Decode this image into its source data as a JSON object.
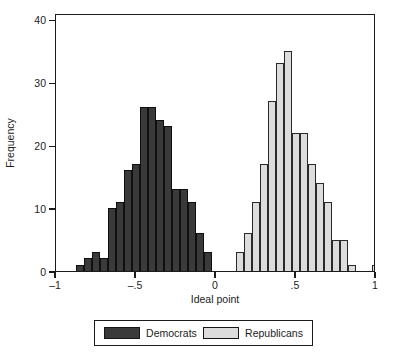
{
  "chart_data": {
    "type": "bar",
    "title": "",
    "subtitle": "",
    "xlabel": "Ideal point",
    "ylabel": "Frequency",
    "xlim": [
      -1.0,
      1.0
    ],
    "ylim": [
      0,
      41
    ],
    "grid": false,
    "legend_position": "bottom",
    "bin_width": 0.05,
    "xticks": [
      {
        "value": -1.0,
        "label": "–1"
      },
      {
        "value": -0.5,
        "label": "–.5"
      },
      {
        "value": 0.0,
        "label": "0"
      },
      {
        "value": 0.5,
        "label": ".5"
      },
      {
        "value": 1.0,
        "label": "1"
      }
    ],
    "yticks": [
      {
        "value": 0,
        "label": "0"
      },
      {
        "value": 10,
        "label": "10"
      },
      {
        "value": 20,
        "label": "20"
      },
      {
        "value": 30,
        "label": "30"
      },
      {
        "value": 40,
        "label": "40"
      }
    ],
    "series": [
      {
        "name": "Democrats",
        "color": "#3a3a3a",
        "bins": [
          {
            "x0": -0.875,
            "x1": -0.825,
            "value": 1
          },
          {
            "x0": -0.825,
            "x1": -0.775,
            "value": 2
          },
          {
            "x0": -0.775,
            "x1": -0.725,
            "value": 3
          },
          {
            "x0": -0.725,
            "x1": -0.675,
            "value": 2
          },
          {
            "x0": -0.675,
            "x1": -0.625,
            "value": 10
          },
          {
            "x0": -0.625,
            "x1": -0.575,
            "value": 11
          },
          {
            "x0": -0.575,
            "x1": -0.525,
            "value": 16
          },
          {
            "x0": -0.525,
            "x1": -0.475,
            "value": 17
          },
          {
            "x0": -0.475,
            "x1": -0.425,
            "value": 26
          },
          {
            "x0": -0.425,
            "x1": -0.375,
            "value": 26
          },
          {
            "x0": -0.375,
            "x1": -0.325,
            "value": 24
          },
          {
            "x0": -0.325,
            "x1": -0.275,
            "value": 23
          },
          {
            "x0": -0.275,
            "x1": -0.225,
            "value": 13
          },
          {
            "x0": -0.225,
            "x1": -0.175,
            "value": 13
          },
          {
            "x0": -0.175,
            "x1": -0.125,
            "value": 11
          },
          {
            "x0": -0.125,
            "x1": -0.075,
            "value": 6
          },
          {
            "x0": -0.075,
            "x1": -0.025,
            "value": 3
          }
        ]
      },
      {
        "name": "Republicans",
        "color": "#dcdcdc",
        "bins": [
          {
            "x0": 0.125,
            "x1": 0.175,
            "value": 3
          },
          {
            "x0": 0.175,
            "x1": 0.225,
            "value": 6
          },
          {
            "x0": 0.225,
            "x1": 0.275,
            "value": 11
          },
          {
            "x0": 0.275,
            "x1": 0.325,
            "value": 17
          },
          {
            "x0": 0.325,
            "x1": 0.375,
            "value": 27
          },
          {
            "x0": 0.375,
            "x1": 0.425,
            "value": 33
          },
          {
            "x0": 0.425,
            "x1": 0.475,
            "value": 35
          },
          {
            "x0": 0.475,
            "x1": 0.525,
            "value": 22
          },
          {
            "x0": 0.525,
            "x1": 0.575,
            "value": 22
          },
          {
            "x0": 0.575,
            "x1": 0.625,
            "value": 17
          },
          {
            "x0": 0.625,
            "x1": 0.675,
            "value": 14
          },
          {
            "x0": 0.675,
            "x1": 0.725,
            "value": 11
          },
          {
            "x0": 0.725,
            "x1": 0.775,
            "value": 5
          },
          {
            "x0": 0.775,
            "x1": 0.825,
            "value": 5
          },
          {
            "x0": 0.825,
            "x1": 0.875,
            "value": 1
          },
          {
            "x0": 0.975,
            "x1": 1.025,
            "value": 1
          }
        ]
      }
    ]
  },
  "legend": {
    "entries": [
      {
        "label": "Democrats",
        "color": "#3a3a3a"
      },
      {
        "label": "Republicans",
        "color": "#dcdcdc"
      }
    ]
  }
}
